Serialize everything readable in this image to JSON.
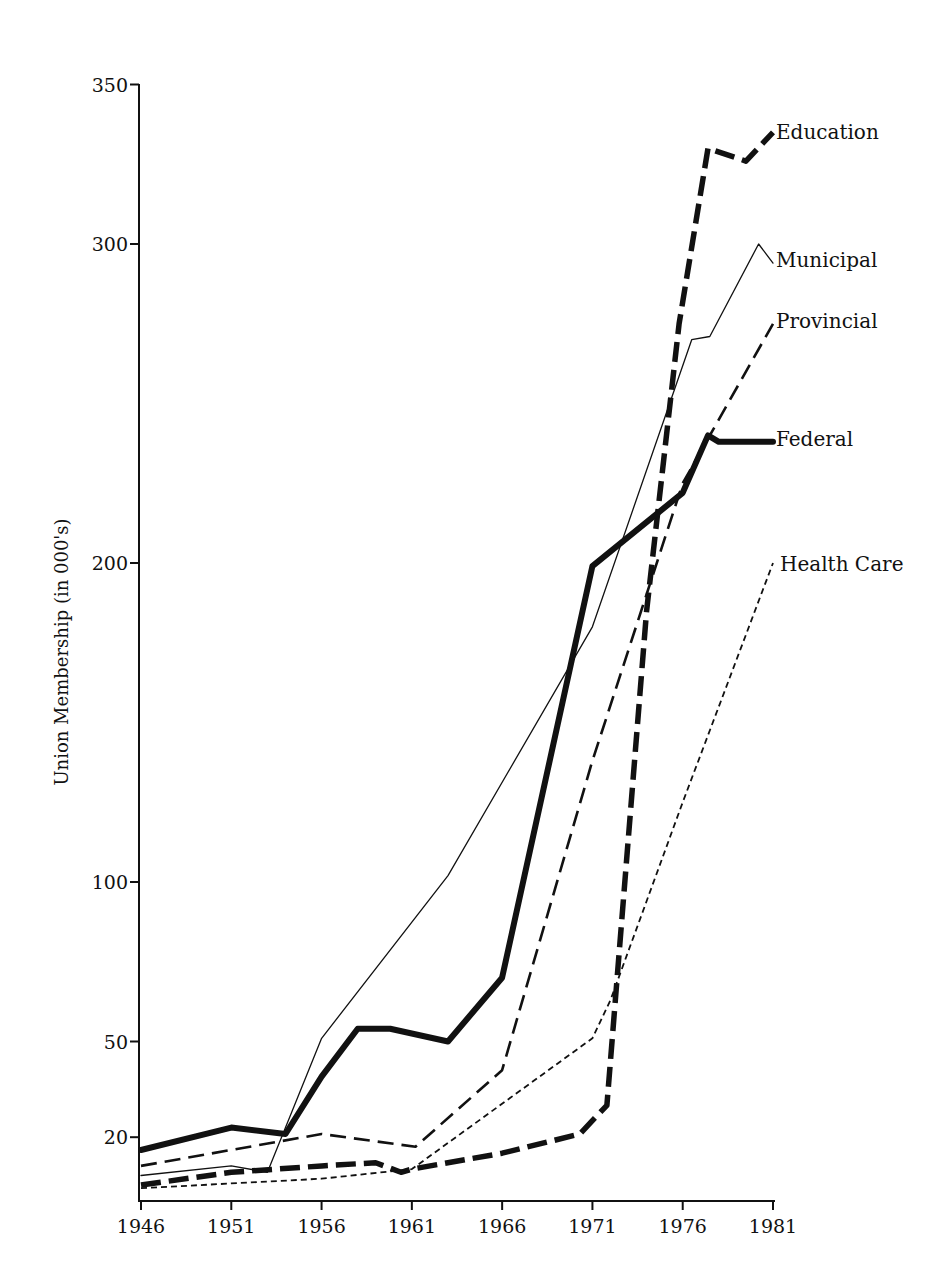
{
  "chart_data": {
    "type": "line",
    "title": "",
    "xlabel": "",
    "ylabel": "Union Membership (in 000's)",
    "xlim": [
      1946,
      1981
    ],
    "ylim": [
      0,
      350
    ],
    "grid": false,
    "legend_position": "inline-right-end-labels",
    "x_ticks": [
      1946,
      1951,
      1956,
      1961,
      1966,
      1971,
      1976,
      1981
    ],
    "y_ticks": [
      20,
      50,
      100,
      200,
      300,
      350
    ],
    "series": [
      {
        "name": "Education",
        "style": "heavy-dash",
        "points": [
          [
            1946,
            5
          ],
          [
            1951,
            9
          ],
          [
            1956,
            11
          ],
          [
            1959,
            12
          ],
          [
            1960.4,
            9
          ],
          [
            1961,
            10
          ],
          [
            1966,
            15
          ],
          [
            1970.3,
            21
          ],
          [
            1971.8,
            30
          ],
          [
            1974,
            185
          ],
          [
            1975.8,
            275
          ],
          [
            1977.4,
            330
          ],
          [
            1979.5,
            326
          ],
          [
            1981,
            335
          ]
        ]
      },
      {
        "name": "Municipal",
        "style": "thin-solid",
        "points": [
          [
            1946,
            8
          ],
          [
            1951,
            11
          ],
          [
            1953,
            9
          ],
          [
            1956,
            51
          ],
          [
            1963,
            102
          ],
          [
            1971,
            180
          ],
          [
            1976.5,
            270
          ],
          [
            1977.5,
            271
          ],
          [
            1980.2,
            300
          ],
          [
            1981,
            294
          ]
        ]
      },
      {
        "name": "Provincial",
        "style": "medium-dash",
        "points": [
          [
            1946,
            11
          ],
          [
            1956,
            21
          ],
          [
            1961.2,
            17
          ],
          [
            1966,
            41
          ],
          [
            1971,
            138
          ],
          [
            1976,
            225
          ],
          [
            1981,
            275
          ]
        ]
      },
      {
        "name": "Federal",
        "style": "heavy-solid",
        "points": [
          [
            1946,
            16
          ],
          [
            1951,
            23
          ],
          [
            1954,
            21
          ],
          [
            1956,
            39
          ],
          [
            1958,
            54
          ],
          [
            1958.5,
            54
          ],
          [
            1959.8,
            54
          ],
          [
            1963,
            50
          ],
          [
            1966,
            70
          ],
          [
            1971,
            199
          ],
          [
            1976,
            222
          ],
          [
            1977.4,
            240
          ],
          [
            1978,
            238
          ],
          [
            1981,
            238
          ]
        ]
      },
      {
        "name": "Health Care",
        "style": "fine-dash",
        "points": [
          [
            1946,
            4
          ],
          [
            1956,
            7
          ],
          [
            1961,
            10
          ],
          [
            1971,
            51
          ],
          [
            1972,
            63
          ],
          [
            1976,
            125
          ],
          [
            1981,
            200
          ]
        ]
      }
    ]
  },
  "y_axis": {
    "title": "Union Membership (in 000's)",
    "ticks": [
      {
        "value": 20,
        "label": "20"
      },
      {
        "value": 50,
        "label": "50"
      },
      {
        "value": 100,
        "label": "100"
      },
      {
        "value": 200,
        "label": "200"
      },
      {
        "value": 300,
        "label": "300"
      },
      {
        "value": 350,
        "label": "350"
      }
    ]
  },
  "x_axis": {
    "ticks": [
      {
        "value": 1946,
        "label": "1946"
      },
      {
        "value": 1951,
        "label": "1951"
      },
      {
        "value": 1956,
        "label": "1956"
      },
      {
        "value": 1961,
        "label": "1961"
      },
      {
        "value": 1966,
        "label": "1966"
      },
      {
        "value": 1971,
        "label": "1971"
      },
      {
        "value": 1976,
        "label": "1976"
      },
      {
        "value": 1981,
        "label": "1981"
      }
    ]
  },
  "series_labels": {
    "education": "Education",
    "municipal": "Municipal",
    "provincial": "Provincial",
    "federal": "Federal",
    "health_care": "Health Care"
  },
  "colors": {
    "ink": "#111111",
    "background": "#ffffff"
  }
}
